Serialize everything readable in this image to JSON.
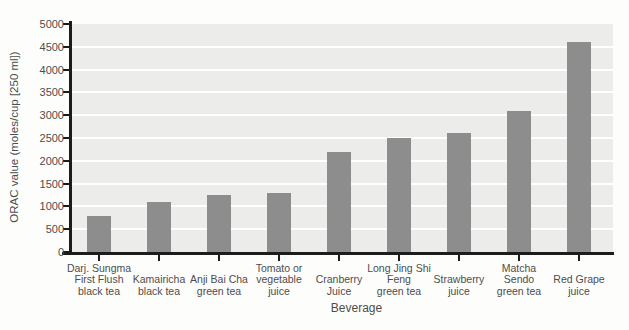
{
  "chart_data": {
    "type": "bar",
    "title": "",
    "xlabel": "Beverage",
    "ylabel": "ORAC value (moles/cup [250 ml])",
    "ylim": [
      0,
      5000
    ],
    "ytick_step": 500,
    "yticks": [
      0,
      500,
      1000,
      1500,
      2000,
      2500,
      3000,
      3500,
      4000,
      4500,
      5000
    ],
    "ytick_labels": [
      "0",
      "500",
      "1000",
      "1500",
      "2000",
      "2500",
      "3000",
      "3500",
      "4000",
      "4500",
      "5000"
    ],
    "grid": "horizontal white gridlines on light-gray plot background",
    "legend": "none",
    "bar_color": "#8d8d8d",
    "plot_background": "#ececea",
    "gridline_color": "#ffffff",
    "axis_color": "#1c1c1c",
    "text_color": "#4d4d4d",
    "categories": [
      "Darj. Sungma First Flush black tea",
      "Kamairicha black tea",
      "Anji Bai Cha green tea",
      "Tomato or vegetable juice",
      "Cranberry Juice",
      "Long Jing Shi Feng green tea",
      "Strawberry juice",
      "Matcha Sendo green tea",
      "Red Grape juice"
    ],
    "category_label_lines": [
      [
        "Darj. Sungma",
        "First Flush",
        "black tea"
      ],
      [
        "Kamairicha",
        "black tea"
      ],
      [
        "Anji Bai Cha",
        "green tea"
      ],
      [
        "Tomato or",
        "vegetable",
        "juice"
      ],
      [
        "Cranberry",
        "Juice"
      ],
      [
        "Long Jing Shi",
        "Feng",
        "green tea"
      ],
      [
        "Strawberry",
        "juice"
      ],
      [
        "Matcha",
        "Sendo",
        "green tea"
      ],
      [
        "Red Grape",
        "juice"
      ]
    ],
    "values": [
      800,
      1100,
      1250,
      1300,
      2200,
      2500,
      2600,
      3100,
      4600
    ]
  }
}
